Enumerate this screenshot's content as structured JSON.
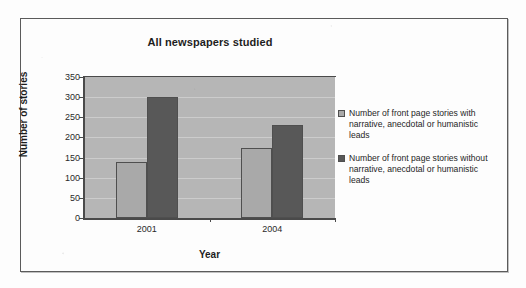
{
  "chart_data": {
    "type": "bar",
    "title": "All newspapers studied",
    "xlabel": "Year",
    "ylabel": "Number of stories",
    "categories": [
      "2001",
      "2004"
    ],
    "series": [
      {
        "name": "Number of front page stories with narrative, anecdotal or humanistic leads",
        "values": [
          138,
          175
        ],
        "color": "#a9a9a9"
      },
      {
        "name": "Number of front page stories without narrative, anecdotal or humanistic leads",
        "values": [
          300,
          230
        ],
        "color": "#585858"
      }
    ],
    "ylim": [
      0,
      350
    ],
    "ytick_labels": [
      "0",
      "50",
      "100",
      "150",
      "200",
      "250",
      "300",
      "350"
    ],
    "ytick_values": [
      0,
      50,
      100,
      150,
      200,
      250,
      300,
      350
    ],
    "grid": true,
    "legend_position": "right",
    "plot_background": "#b6b6b6"
  },
  "legend": {
    "items": [
      {
        "label": "Number of front page stories with narrative, anecdotal or humanistic leads",
        "swatch": "series-1-swatch"
      },
      {
        "label": "Number of front page stories without narrative, anecdotal or humanistic leads",
        "swatch": "series-2-swatch"
      }
    ]
  },
  "frame": {
    "border_color": "#5b5b5b"
  }
}
